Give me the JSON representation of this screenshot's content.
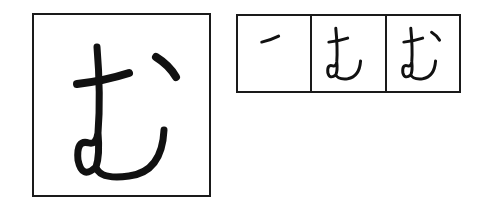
{
  "character": {
    "glyph": "む",
    "romanization": "mu",
    "script": "hiragana"
  },
  "stroke_order": {
    "step_count": 3,
    "steps": [
      {
        "step": 1,
        "label": "stroke 1"
      },
      {
        "step": 2,
        "label": "strokes 1-2"
      },
      {
        "step": 3,
        "label": "strokes 1-3"
      }
    ]
  },
  "colors": {
    "ink": "#111111",
    "border": "#1a1a1a",
    "background": "#ffffff"
  }
}
